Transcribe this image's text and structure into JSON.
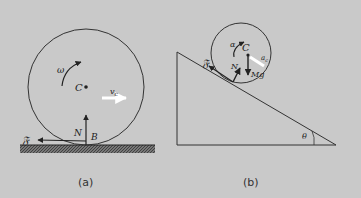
{
  "panel_a": {
    "caption": "(a)",
    "omega": "ω",
    "center": "C",
    "velocity": "v",
    "velocity_sub": "c",
    "normal": "N",
    "contact": "B",
    "friction": "𝔉"
  },
  "panel_b": {
    "caption": "(b)",
    "alpha": "α",
    "center": "C",
    "accel": "a",
    "accel_sub": "c",
    "normal": "N",
    "weight": "Mg",
    "friction": "𝔉",
    "angle": "θ"
  },
  "colors": {
    "background": "#c9c9c9",
    "ink": "#222222"
  }
}
